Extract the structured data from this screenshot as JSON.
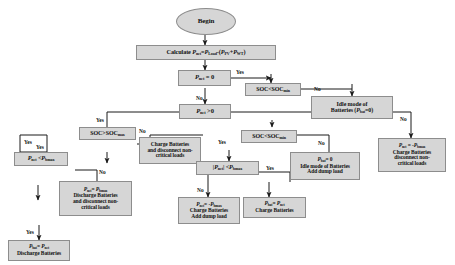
{
  "diagram": {
    "colors": {
      "node_fill": "#d6d6d6",
      "node_border": "#8d8d8d",
      "line": "#1a1a1a",
      "background": "#ffffff",
      "text": "#121212"
    },
    "nodes": {
      "begin": {
        "label": "Begin",
        "shape": "oval"
      },
      "calculate": {
        "label": "Calculate Pnet=PLoad-(PPV+PWT)",
        "shape": "process"
      },
      "pnet_zero": {
        "label": "Pnet = 0",
        "shape": "decision"
      },
      "soc_lt_socmin_1": {
        "label": "SOC<SOCmin",
        "shape": "decision"
      },
      "idle_batteries_1": {
        "label": "Idle mode of Batteries (Pbat=0)",
        "shape": "process"
      },
      "pnet_gt_zero": {
        "label": "Pnet >0",
        "shape": "decision"
      },
      "soc_gt_socmax": {
        "label": "SOC>SOCmax",
        "shape": "decision"
      },
      "charge_disconnect": {
        "label": "Charge Batteries and disconnect non-critical loads",
        "shape": "process"
      },
      "soc_lt_socmin_2": {
        "label": "SOC<SOCmin",
        "shape": "decision"
      },
      "pnet_lt_pbmax": {
        "label": "Pnet <Pbmax",
        "shape": "decision"
      },
      "abs_pnet_lt_pbmax": {
        "label": "|Pnet| <Pbmax",
        "shape": "decision"
      },
      "pbat_zero_dump": {
        "label": "Pbat= 0 Idle mode of Batteries Add dump load",
        "shape": "process"
      },
      "pnet_neg_pbmax": {
        "label": "Pnet= -Pbmax Charge Batteries Add dump load",
        "shape": "process"
      },
      "pbat_eq_pnet_charge": {
        "label": "Pbat= Pnet Charge Batteries",
        "shape": "process"
      },
      "pnet_eq_pbmax_discharge": {
        "label": "Pnet= Pbmax Discharge Batteries and disconnect non-critical loads",
        "shape": "process"
      },
      "pbat_eq_pnet_discharge": {
        "label": "Pbat= Pnet Discharge Batteries",
        "shape": "process"
      },
      "pnet_neg_pbmax_charge_disc": {
        "label": "Pnet= -Pbmax Charge Batteries disconnect non-critical loads",
        "shape": "process"
      }
    },
    "edge_labels": {
      "yes_1": "Yes",
      "no_1": "No",
      "yes_2": "Yes",
      "no_2": "No",
      "yes_3": "Yes",
      "no_3": "No",
      "yes_4": "Yes",
      "no_4": "No",
      "yes_5": "Yes",
      "no_5": "No",
      "yes_6": "Yes",
      "no_6": "No",
      "yes_7": "Yes",
      "no_7": "No"
    }
  }
}
